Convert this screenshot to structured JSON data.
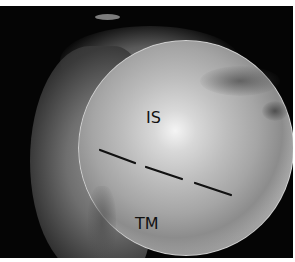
{
  "image": {
    "description": "Grayscale circular endoscopic view with two anatomical labels and a dashed boundary line",
    "background_color": "#050505",
    "border_color": "#ffffff"
  },
  "labels": {
    "upper": "IS",
    "lower": "TM"
  },
  "boundary_line": {
    "style": "dashed",
    "color": "#111111",
    "segments": [
      {
        "x1": 100,
        "y1": 150,
        "x2": 135,
        "y2": 163
      },
      {
        "x1": 146,
        "y1": 167,
        "x2": 182,
        "y2": 179
      },
      {
        "x1": 195,
        "y1": 183,
        "x2": 231,
        "y2": 195
      }
    ]
  }
}
